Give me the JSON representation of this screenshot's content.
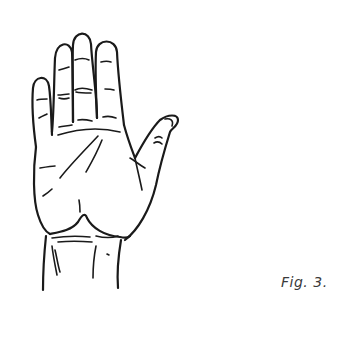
{
  "figure": {
    "caption": "Fig. 3.",
    "colors": {
      "ink": "#1a1a1a",
      "caption": "#3a3a3a",
      "background": "#ffffff"
    }
  }
}
